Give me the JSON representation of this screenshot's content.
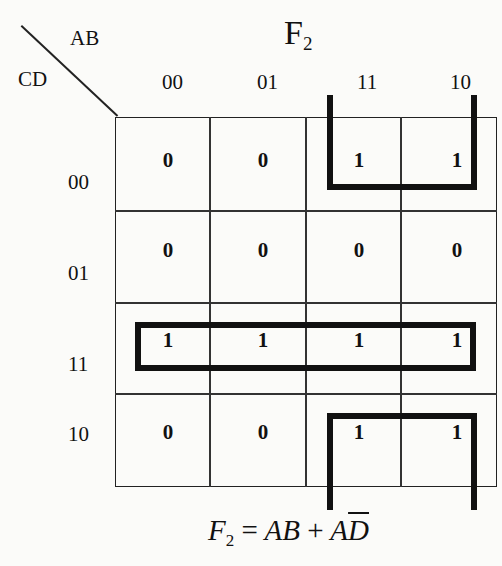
{
  "title": {
    "main": "F",
    "subscript": "2"
  },
  "axis": {
    "columns_var": "AB",
    "rows_var": "CD"
  },
  "column_labels": [
    "00",
    "01",
    "11",
    "10"
  ],
  "row_labels": [
    "00",
    "01",
    "11",
    "10"
  ],
  "cells": [
    [
      "0",
      "0",
      "1",
      "1"
    ],
    [
      "0",
      "0",
      "0",
      "0"
    ],
    [
      "1",
      "1",
      "1",
      "1"
    ],
    [
      "0",
      "0",
      "1",
      "1"
    ]
  ],
  "groupings": [
    {
      "name": "AB-group",
      "cells": "row 00 and row 10, columns 11 and 10 (wraparound)"
    },
    {
      "name": "CD-11-row",
      "cells": "row 11, all columns"
    }
  ],
  "equation": {
    "lhs": "F",
    "lhs_sub": "2",
    "eq": "=",
    "term1": "AB",
    "plus": "+",
    "term2_a": "A",
    "term2_d": "D"
  }
}
